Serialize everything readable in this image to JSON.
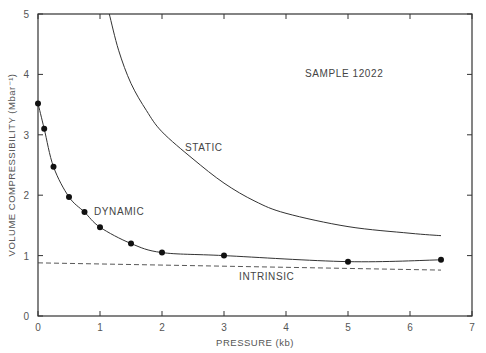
{
  "chart_data": {
    "type": "line",
    "title": "",
    "xlabel": "PRESSURE  (kb)",
    "ylabel": "VOLUME  COMPRESSIBILITY  (Mbar⁻¹)",
    "xlim": [
      0,
      7
    ],
    "ylim": [
      0,
      5
    ],
    "xticks": [
      "0",
      "1",
      "2",
      "3",
      "4",
      "5",
      "6",
      "7"
    ],
    "yticks": [
      "0",
      "1",
      "2",
      "3",
      "4",
      "5"
    ],
    "grid": false,
    "annotations": [
      "SAMPLE  12022",
      "STATIC",
      "DYNAMIC",
      "INTRINSIC"
    ],
    "series": [
      {
        "name": "DYNAMIC",
        "style": "solid line with filled circle markers",
        "x": [
          0,
          0.1,
          0.25,
          0.5,
          0.75,
          1.0,
          1.5,
          2.0,
          3.0,
          5.0,
          6.5
        ],
        "values": [
          3.52,
          3.1,
          2.47,
          1.97,
          1.72,
          1.47,
          1.2,
          1.05,
          1.0,
          0.9,
          0.93
        ]
      },
      {
        "name": "STATIC",
        "style": "solid line",
        "x": [
          1.15,
          1.3,
          1.5,
          1.75,
          2.0,
          2.5,
          3.0,
          3.5,
          4.0,
          5.0,
          6.0,
          6.5
        ],
        "values": [
          5.0,
          4.4,
          3.85,
          3.4,
          3.05,
          2.6,
          2.2,
          1.9,
          1.7,
          1.48,
          1.37,
          1.33
        ]
      },
      {
        "name": "INTRINSIC",
        "style": "dashed line",
        "x": [
          0,
          6.5
        ],
        "values": [
          0.88,
          0.76
        ]
      }
    ]
  },
  "labels": {
    "sample": "SAMPLE  12022",
    "static": "STATIC",
    "dynamic": "DYNAMIC",
    "intrinsic": "INTRINSIC",
    "xlabel": "PRESSURE  (kb)",
    "ylabel": "VOLUME  COMPRESSIBILITY  (Mbar⁻¹)"
  }
}
